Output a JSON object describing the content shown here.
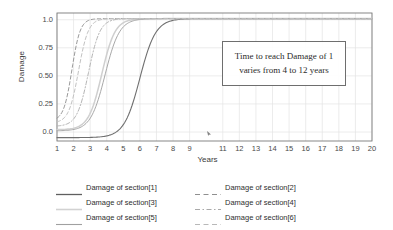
{
  "chart_data": {
    "type": "line",
    "title": "",
    "xlabel": "Years",
    "ylabel": "Damage",
    "xlim": [
      1,
      20
    ],
    "ylim": [
      -0.08,
      1.06
    ],
    "grid": true,
    "xticks": [
      "1",
      "2",
      "3",
      "4",
      "5",
      "6",
      "7",
      "8",
      "9",
      "11",
      "12",
      "13",
      "14",
      "15",
      "16",
      "17",
      "18",
      "19",
      "20"
    ],
    "xtick_values": [
      1,
      2,
      3,
      4,
      5,
      6,
      7,
      8,
      9,
      11,
      12,
      13,
      14,
      15,
      16,
      17,
      18,
      19,
      20
    ],
    "yticks": [
      "1.0",
      "0.75",
      "0.50",
      "0.25",
      "0.0"
    ],
    "ytick_values": [
      1.0,
      0.75,
      0.5,
      0.25,
      0.0
    ],
    "legend_position": "below",
    "annotations": [
      {
        "name": "time-to-damage-note",
        "line1": "Time to reach Damage of 1",
        "line2": "varies from 4 to 12 years"
      }
    ],
    "series": [
      {
        "name": "Damage of section[1]",
        "style": "solid",
        "color": "#6f6f6f",
        "width": 1.1,
        "midpoint": 6.0,
        "steepness": 1.05,
        "y0": -0.05,
        "x": [
          1,
          1.5,
          2,
          2.5,
          3,
          3.5,
          4,
          4.5,
          5,
          5.5,
          6,
          6.5,
          7,
          7.5,
          8,
          8.5,
          9,
          10,
          11,
          12,
          14,
          16,
          18,
          20
        ],
        "values": [
          -0.04,
          -0.03,
          -0.02,
          0.0,
          0.02,
          0.05,
          0.1,
          0.18,
          0.3,
          0.45,
          0.6,
          0.73,
          0.84,
          0.91,
          0.96,
          0.98,
          1.0,
          1.01,
          1.01,
          1.01,
          1.01,
          1.01,
          1.01,
          1.01
        ]
      },
      {
        "name": "Damage of section[2]",
        "style": "dashed",
        "color": "#9a9a9a",
        "width": 1.0,
        "midpoint": 1.9,
        "steepness": 2.0,
        "y0": 0.1,
        "x": [
          1,
          1.25,
          1.5,
          1.75,
          2,
          2.25,
          2.5,
          2.75,
          3,
          3.25,
          3.5,
          4,
          5,
          6,
          8,
          10,
          12,
          16,
          20
        ],
        "values": [
          0.12,
          0.2,
          0.3,
          0.42,
          0.55,
          0.67,
          0.78,
          0.86,
          0.92,
          0.96,
          0.98,
          1.0,
          1.01,
          1.01,
          1.01,
          1.01,
          1.01,
          1.01,
          1.01
        ]
      },
      {
        "name": "Damage of section[3]",
        "style": "solid",
        "color": "#cfcfcf",
        "width": 1.5,
        "midpoint": 3.7,
        "steepness": 1.25,
        "y0": 0.02,
        "x": [
          1,
          1.5,
          2,
          2.5,
          3,
          3.5,
          4,
          4.5,
          5,
          5.5,
          6,
          6.5,
          7,
          7.5,
          8,
          9,
          10,
          12,
          16,
          20
        ],
        "values": [
          0.03,
          0.07,
          0.14,
          0.24,
          0.38,
          0.52,
          0.65,
          0.76,
          0.85,
          0.91,
          0.95,
          0.98,
          0.99,
          1.0,
          1.01,
          1.01,
          1.01,
          1.01,
          1.01,
          1.01
        ]
      },
      {
        "name": "Damage of section[4]",
        "style": "dashdot",
        "color": "#b5b5b5",
        "width": 1.0,
        "midpoint": 2.9,
        "steepness": 1.45,
        "y0": 0.05,
        "x": [
          1,
          1.5,
          2,
          2.5,
          3,
          3.5,
          4,
          4.5,
          5,
          5.5,
          6,
          7,
          8,
          10,
          12,
          16,
          20
        ],
        "values": [
          0.06,
          0.13,
          0.24,
          0.39,
          0.54,
          0.69,
          0.8,
          0.89,
          0.94,
          0.97,
          0.99,
          1.0,
          1.01,
          1.01,
          1.01,
          1.01,
          1.01
        ]
      },
      {
        "name": "Damage of section[5]",
        "style": "solid",
        "color": "#a8a8a8",
        "width": 1.0,
        "midpoint": 3.9,
        "steepness": 1.15,
        "y0": 0.01,
        "x": [
          1,
          1.5,
          2,
          2.5,
          3,
          3.5,
          4,
          4.5,
          5,
          5.5,
          6,
          6.5,
          7,
          7.5,
          8,
          9,
          10,
          12,
          16,
          20
        ],
        "values": [
          0.02,
          0.05,
          0.11,
          0.2,
          0.32,
          0.46,
          0.6,
          0.72,
          0.82,
          0.89,
          0.94,
          0.97,
          0.99,
          1.0,
          1.0,
          1.01,
          1.01,
          1.01,
          1.01,
          1.01
        ]
      },
      {
        "name": "Damage of section[6]",
        "style": "dashed",
        "color": "#c2c2c2",
        "width": 1.0,
        "midpoint": 2.3,
        "steepness": 1.7,
        "y0": 0.08,
        "x": [
          1,
          1.25,
          1.5,
          2,
          2.5,
          3,
          3.5,
          4,
          4.5,
          5,
          5.5,
          6,
          7,
          8,
          10,
          12,
          16,
          20
        ],
        "values": [
          0.09,
          0.14,
          0.2,
          0.37,
          0.55,
          0.71,
          0.83,
          0.91,
          0.96,
          0.98,
          0.99,
          1.0,
          1.01,
          1.01,
          1.01,
          1.01,
          1.01,
          1.01
        ]
      }
    ]
  },
  "legend": {
    "rows": [
      [
        {
          "label": "Damage of section[1]",
          "style": "solid",
          "color": "#5f5f5f",
          "width": 1.3
        },
        {
          "label": "Damage of section[2]",
          "style": "dashed",
          "color": "#8f8f8f",
          "width": 1.0
        }
      ],
      [
        {
          "label": "Damage of section[3]",
          "style": "solid",
          "color": "#d2d2d2",
          "width": 1.6
        },
        {
          "label": "Damage of section[4]",
          "style": "dashdot",
          "color": "#a9a9a9",
          "width": 1.0
        }
      ],
      [
        {
          "label": "Damage of section[5]",
          "style": "solid",
          "color": "#a0a0a0",
          "width": 1.1
        },
        {
          "label": "Damage of section[6]",
          "style": "dashed",
          "color": "#b8b8b8",
          "width": 1.0
        }
      ]
    ]
  },
  "colors": {
    "frame": "#7a7a7a",
    "grid": "#e4e4e4",
    "tick_text": "#4a4a4a",
    "axis_title": "#3a3a3a",
    "annotation_border": "#6e6e6e",
    "background": "#ffffff"
  },
  "plot_area": {
    "left": 57,
    "top": 13,
    "right": 372,
    "bottom": 141
  }
}
